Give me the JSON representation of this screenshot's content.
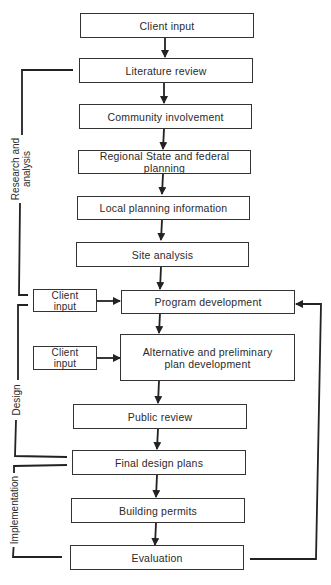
{
  "diagram": {
    "type": "flowchart",
    "main_flow": [
      {
        "id": "client_input_top",
        "label": "Client input"
      },
      {
        "id": "literature_review",
        "label": "Literature review"
      },
      {
        "id": "community_involvement",
        "label": "Community involvement"
      },
      {
        "id": "regional_planning",
        "label": "Regional State and federal planning"
      },
      {
        "id": "local_planning",
        "label": "Local planning information"
      },
      {
        "id": "site_analysis",
        "label": "Site analysis"
      },
      {
        "id": "program_development",
        "label": "Program development"
      },
      {
        "id": "alternative_plan",
        "label": "Alternative and preliminary plan development"
      },
      {
        "id": "public_review",
        "label": "Public review"
      },
      {
        "id": "final_design",
        "label": "Final design plans"
      },
      {
        "id": "building_permits",
        "label": "Building permits"
      },
      {
        "id": "evaluation",
        "label": "Evaluation"
      }
    ],
    "side_inputs": [
      {
        "id": "client_input_1",
        "label": "Client input",
        "target": "program_development"
      },
      {
        "id": "client_input_2",
        "label": "Client input",
        "target": "alternative_plan"
      }
    ],
    "phases": [
      {
        "label": "Research and analysis",
        "from": "literature_review",
        "to": "program_development"
      },
      {
        "label": "Design",
        "from": "program_development",
        "to": "final_design"
      },
      {
        "label": "Implementation",
        "from": "final_design",
        "to": "evaluation"
      }
    ],
    "feedback": {
      "from": "evaluation",
      "to": "program_development"
    }
  },
  "labels": {
    "b0": "Client input",
    "b1": "Literature review",
    "b2": "Community involvement",
    "b3": "Regional State and federal planning",
    "b4": "Local planning information",
    "b5": "Site analysis",
    "b6": "Program development",
    "b7a": "Alternative and preliminary",
    "b7b": "plan development",
    "b8": "Public review",
    "b9": "Final design plans",
    "b10": "Building permits",
    "b11": "Evaluation",
    "ci1a": "Client",
    "ci1b": "input",
    "ci2a": "Client",
    "ci2b": "input",
    "phase_research_a": "Research and",
    "phase_research_b": "analysis",
    "phase_design": "Design",
    "phase_impl": "Implementation"
  }
}
